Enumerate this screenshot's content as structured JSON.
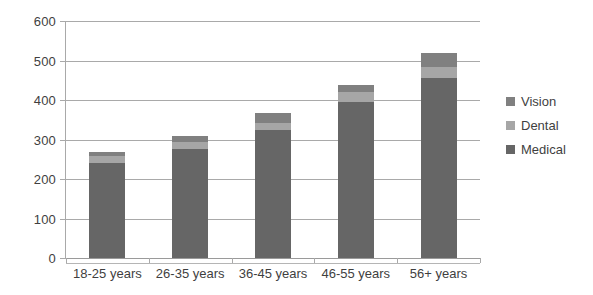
{
  "chart_data": {
    "type": "bar",
    "stacked": true,
    "title": "",
    "xlabel": "",
    "ylabel": "",
    "ylim": [
      0,
      600
    ],
    "ytick_step": 100,
    "yticks": [
      "600",
      "500",
      "400",
      "300",
      "200",
      "100",
      "0"
    ],
    "grid": true,
    "legend_position": "right",
    "categories": [
      "18-25 years",
      "26-35 years",
      "36-45 years",
      "46-55 years",
      "56+ years"
    ],
    "series": [
      {
        "name": "Medical",
        "color": "#666666",
        "values": [
          240,
          275,
          325,
          395,
          455
        ]
      },
      {
        "name": "Dental",
        "color": "#a6a6a6",
        "values": [
          18,
          19,
          17,
          25,
          28
        ]
      },
      {
        "name": "Vision",
        "color": "#808080",
        "values": [
          10,
          15,
          25,
          18,
          36
        ]
      }
    ],
    "totals": [
      268,
      309,
      367,
      438,
      519
    ]
  },
  "legend": {
    "items": [
      {
        "label": "Vision",
        "color": "#808080"
      },
      {
        "label": "Dental",
        "color": "#a6a6a6"
      },
      {
        "label": "Medical",
        "color": "#666666"
      }
    ]
  },
  "colors": {
    "gridline": "#a9a9a9",
    "text": "#3f3f3f",
    "background": "#ffffff"
  }
}
